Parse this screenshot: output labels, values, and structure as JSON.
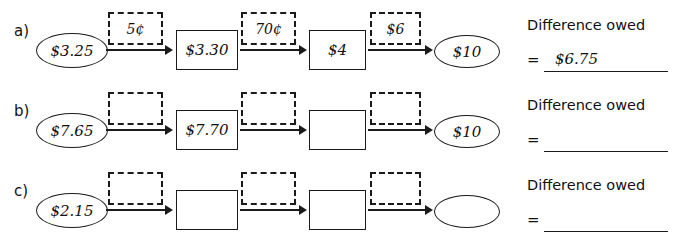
{
  "worksheet": {
    "rows": [
      {
        "label": "a)",
        "start_oval": "$3.25",
        "step1_dashed": "5¢",
        "box1": "$3.30",
        "step2_dashed": "70¢",
        "box2": "$4",
        "step3_dashed": "$6",
        "end_oval": "$10",
        "answer_title": "Difference owed",
        "answer_equals": "=",
        "answer_value": "$6.75"
      },
      {
        "label": "b)",
        "start_oval": "$7.65",
        "step1_dashed": "",
        "box1": "$7.70",
        "step2_dashed": "",
        "box2": "",
        "step3_dashed": "",
        "end_oval": "$10",
        "answer_title": "Difference owed",
        "answer_equals": "=",
        "answer_value": ""
      },
      {
        "label": "c)",
        "start_oval": "$2.15",
        "step1_dashed": "",
        "box1": "",
        "step2_dashed": "",
        "box2": "",
        "step3_dashed": "",
        "end_oval": "",
        "answer_title": "Difference owed",
        "answer_equals": "=",
        "answer_value": ""
      }
    ]
  }
}
